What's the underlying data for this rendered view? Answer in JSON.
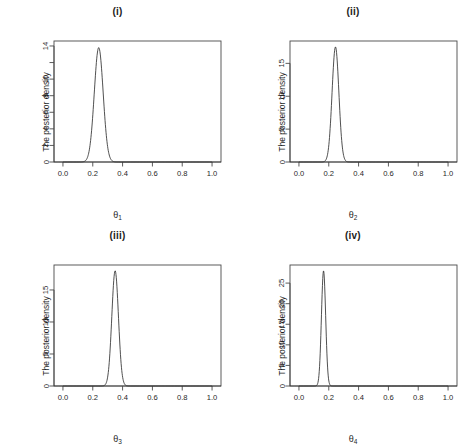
{
  "figure": {
    "background": "#ffffff",
    "line_color": "#303030",
    "axis_color": "#4a4a4a",
    "layout": "2x2 grid of marginal posterior density plots"
  },
  "chart_data": [
    {
      "type": "line",
      "panel_id": "i",
      "title": "(i)",
      "xlabel": "θ₁",
      "xlabel_base": "θ",
      "xlabel_sub": "1",
      "ylabel": "The posterior density",
      "xlim": [
        -0.06,
        1.06
      ],
      "ylim": [
        0,
        14.6
      ],
      "xticks": [
        0.0,
        0.2,
        0.4,
        0.6,
        0.8,
        1.0
      ],
      "xticklabels": [
        "0.0",
        "0.2",
        "0.4",
        "0.6",
        "0.8",
        "1.0"
      ],
      "yticks": [
        0,
        2,
        4,
        6,
        8,
        10,
        12,
        14
      ],
      "yticklabels": [
        "0",
        "2",
        "4",
        "6",
        "8",
        "10",
        "",
        "14"
      ],
      "grid": false,
      "legend": null,
      "peak_x": 0.24,
      "peak_y": 13.8,
      "sd": 0.0298,
      "x": [
        0.0,
        0.02,
        0.04,
        0.06,
        0.08,
        0.1,
        0.12,
        0.14,
        0.16,
        0.18,
        0.2,
        0.22,
        0.24,
        0.26,
        0.28,
        0.3,
        0.32,
        0.34,
        0.36,
        0.38,
        0.4,
        0.45,
        0.5,
        0.6,
        0.7,
        0.8,
        0.9,
        1.0
      ],
      "values": [
        0.0,
        0.0,
        0.0,
        0.0,
        0.0,
        0.0,
        0.02,
        0.2,
        1.08,
        3.62,
        7.82,
        11.97,
        13.8,
        12.5,
        8.45,
        4.3,
        1.63,
        0.46,
        0.1,
        0.02,
        0.0,
        0.0,
        0.0,
        0.0,
        0.0,
        0.0,
        0.0,
        0.0
      ]
    },
    {
      "type": "line",
      "panel_id": "ii",
      "title": "(ii)",
      "xlabel": "θ₂",
      "xlabel_base": "θ",
      "xlabel_sub": "2",
      "ylabel": "The posterior density",
      "xlim": [
        -0.06,
        1.06
      ],
      "ylim": [
        0,
        18.4
      ],
      "xticks": [
        0.0,
        0.2,
        0.4,
        0.6,
        0.8,
        1.0
      ],
      "xticklabels": [
        "0.0",
        "0.2",
        "0.4",
        "0.6",
        "0.8",
        "1.0"
      ],
      "yticks": [
        0,
        5,
        10,
        15
      ],
      "yticklabels": [
        "0",
        "5",
        "10",
        "15"
      ],
      "grid": false,
      "legend": null,
      "peak_x": 0.245,
      "peak_y": 17.5,
      "sd": 0.0228,
      "x": [
        0.0,
        0.02,
        0.04,
        0.06,
        0.08,
        0.1,
        0.12,
        0.14,
        0.16,
        0.18,
        0.2,
        0.22,
        0.245,
        0.26,
        0.28,
        0.3,
        0.32,
        0.34,
        0.36,
        0.38,
        0.4,
        0.5,
        0.6,
        0.7,
        0.8,
        0.9,
        1.0
      ],
      "values": [
        0.0,
        0.0,
        0.0,
        0.0,
        0.0,
        0.0,
        0.0,
        0.02,
        0.22,
        1.4,
        5.12,
        12.2,
        17.5,
        16.2,
        9.8,
        3.7,
        0.85,
        0.12,
        0.01,
        0.0,
        0.0,
        0.0,
        0.0,
        0.0,
        0.0,
        0.0,
        0.0
      ]
    },
    {
      "type": "line",
      "panel_id": "iii",
      "title": "(iii)",
      "xlabel": "θ₃",
      "xlabel_base": "θ",
      "xlabel_sub": "3",
      "ylabel": "The posterior density",
      "xlim": [
        -0.06,
        1.06
      ],
      "ylim": [
        0,
        18.9
      ],
      "xticks": [
        0.0,
        0.2,
        0.4,
        0.6,
        0.8,
        1.0
      ],
      "xticklabels": [
        "0.0",
        "0.2",
        "0.4",
        "0.6",
        "0.8",
        "1.0"
      ],
      "yticks": [
        0,
        5,
        10,
        15
      ],
      "yticklabels": [
        "0",
        "5",
        "10",
        "15"
      ],
      "grid": false,
      "legend": null,
      "peak_x": 0.35,
      "peak_y": 18.0,
      "sd": 0.0222,
      "x": [
        0.0,
        0.05,
        0.1,
        0.15,
        0.2,
        0.24,
        0.26,
        0.28,
        0.3,
        0.32,
        0.35,
        0.37,
        0.39,
        0.41,
        0.43,
        0.45,
        0.5,
        0.6,
        0.7,
        0.8,
        0.9,
        1.0
      ],
      "values": [
        0.0,
        0.0,
        0.0,
        0.0,
        0.0,
        0.02,
        0.12,
        0.7,
        2.9,
        8.6,
        18.0,
        14.6,
        6.6,
        1.7,
        0.26,
        0.03,
        0.0,
        0.0,
        0.0,
        0.0,
        0.0,
        0.0
      ]
    },
    {
      "type": "line",
      "panel_id": "iv",
      "title": "(iv)",
      "xlabel": "θ₄",
      "xlabel_base": "θ",
      "xlabel_sub": "4",
      "ylabel": "The posterior density",
      "xlim": [
        -0.06,
        1.06
      ],
      "ylim": [
        0,
        29.4
      ],
      "xticks": [
        0.0,
        0.2,
        0.4,
        0.6,
        0.8,
        1.0
      ],
      "xticklabels": [
        "0.0",
        "0.2",
        "0.4",
        "0.6",
        "0.8",
        "1.0"
      ],
      "yticks": [
        0,
        5,
        10,
        15,
        20,
        25
      ],
      "yticklabels": [
        "0",
        "5",
        "10",
        "15",
        "20",
        "25"
      ],
      "grid": false,
      "legend": null,
      "peak_x": 0.165,
      "peak_y": 28.0,
      "sd": 0.0142,
      "x": [
        0.0,
        0.04,
        0.08,
        0.1,
        0.12,
        0.13,
        0.14,
        0.15,
        0.165,
        0.18,
        0.19,
        0.2,
        0.21,
        0.22,
        0.24,
        0.26,
        0.3,
        0.4,
        0.5,
        0.6,
        0.7,
        0.8,
        0.9,
        1.0
      ],
      "values": [
        0.0,
        0.0,
        0.0,
        0.02,
        0.46,
        1.8,
        5.6,
        14.2,
        28.0,
        20.8,
        12.4,
        5.6,
        1.9,
        0.52,
        0.03,
        0.0,
        0.0,
        0.0,
        0.0,
        0.0,
        0.0,
        0.0,
        0.0,
        0.0
      ]
    }
  ]
}
